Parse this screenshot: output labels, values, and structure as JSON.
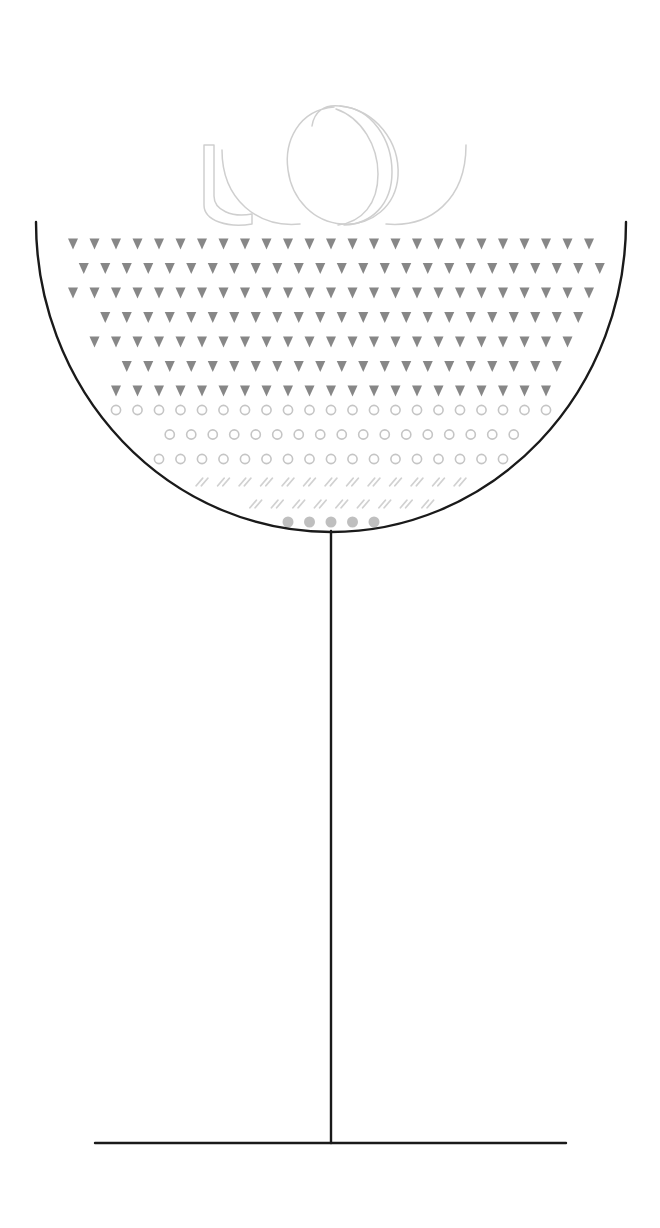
{
  "canvas": {
    "width": 660,
    "height": 1228,
    "background": "#ffffff"
  },
  "illustration": {
    "title": "Cocktail Glass With Layered Texture Fill",
    "subject": "coupe-cocktail-glass",
    "style": "line-art-monochrome",
    "line_color": "#1a1a1a",
    "line_width": 2.2
  },
  "glass": {
    "bowl": {
      "name": "glass-bowl",
      "shape": "half-ellipse",
      "rim_left_x": 36,
      "rim_right_x": 626,
      "rim_y": 222,
      "bottom_y": 532,
      "center_x": 331,
      "radius_x": 295,
      "radius_y": 310,
      "stroke": "#1a1a1a",
      "stroke_width": 2.4
    },
    "stem": {
      "name": "glass-stem",
      "x": 331,
      "top_y": 532,
      "bottom_y": 1143,
      "stroke": "#1a1a1a",
      "stroke_width": 2.4
    },
    "base": {
      "name": "glass-base",
      "y": 1143,
      "left_x": 95,
      "right_x": 566,
      "stroke": "#1a1a1a",
      "stroke_width": 2.4
    }
  },
  "fill_layers": [
    {
      "name": "triangle-layer",
      "marker": "triangle-down",
      "label": "Downward Triangles",
      "color": "#7d7d7d",
      "rows": 7,
      "row_start_y": 244,
      "row_spacing": 24.5,
      "col_spacing": 21.5,
      "marker_width": 10,
      "marker_height": 11,
      "opacity": 0.92
    },
    {
      "name": "circle-layer",
      "marker": "circle-outline",
      "label": "Open Circles",
      "color": "#c2c2c2",
      "rows": 3,
      "row_start_y": 410,
      "row_spacing": 24.5,
      "col_spacing": 21.5,
      "marker_radius": 4.6,
      "stroke_width": 1.6,
      "opacity": 0.95
    },
    {
      "name": "slash-layer",
      "marker": "double-slash",
      "label": "Double Slashes",
      "color": "#cfcfcf",
      "rows": 2,
      "row_start_y": 482,
      "row_spacing": 22,
      "col_spacing": 21.5,
      "marker_length": 9,
      "stroke_width": 1.8,
      "opacity": 0.95
    },
    {
      "name": "dot-layer",
      "marker": "filled-dot",
      "label": "Filled Dots",
      "color": "#b9b9b9",
      "rows": 1,
      "row_start_y": 522,
      "row_spacing": 22,
      "col_spacing": 21.5,
      "marker_radius": 5.5,
      "opacity": 0.9
    }
  ],
  "ornament": {
    "name": "aroma-swirls",
    "label": "Decorative Swirl Ribbons",
    "color": "#cfcfcf",
    "stroke_width": 1.5,
    "curl_count": 3,
    "top_y": 103,
    "bottom_y": 224,
    "left_x": 200,
    "right_x": 468,
    "strokes": [
      {
        "name": "ribbon-curl-left",
        "kind": "open-ribbon-band"
      },
      {
        "name": "loop-curl-middle",
        "kind": "teardrop-loop"
      },
      {
        "name": "loop-curl-right",
        "kind": "teardrop-loop"
      },
      {
        "name": "arc-curl-far-right",
        "kind": "open-arc"
      }
    ]
  },
  "accessibility": {
    "alt_text": "Line drawing of a stemmed cocktail coupe glass whose bowl is filled with banded rows of gray triangles, open circles, double slashes and solid dots, with pale swirling ribbons drifting above the rim."
  }
}
